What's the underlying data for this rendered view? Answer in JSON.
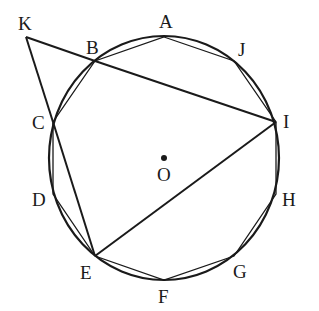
{
  "diagram": {
    "title": "",
    "type": "geometry",
    "colors": {
      "ink": "#1a1a1a",
      "background": "#ffffff"
    },
    "circle": {
      "center": "O",
      "cx": 164,
      "cy": 158,
      "rx": 115,
      "ry": 122
    },
    "points": [
      {
        "name": "A",
        "x": 164,
        "y": 37,
        "label": "A",
        "lx": 159,
        "ly": 28
      },
      {
        "name": "J",
        "x": 234,
        "y": 61,
        "label": "J",
        "lx": 238,
        "ly": 56
      },
      {
        "name": "I",
        "x": 276,
        "y": 122,
        "label": "I",
        "lx": 283,
        "ly": 128
      },
      {
        "name": "H",
        "x": 276,
        "y": 194,
        "label": "H",
        "lx": 282,
        "ly": 206
      },
      {
        "name": "G",
        "x": 234,
        "y": 256,
        "label": "G",
        "lx": 233,
        "ly": 278
      },
      {
        "name": "F",
        "x": 164,
        "y": 280,
        "label": "F",
        "lx": 158,
        "ly": 303
      },
      {
        "name": "E",
        "x": 95,
        "y": 256,
        "label": "E",
        "lx": 80,
        "ly": 279
      },
      {
        "name": "D",
        "x": 53,
        "y": 194,
        "label": "D",
        "lx": 32,
        "ly": 206
      },
      {
        "name": "C",
        "x": 53,
        "y": 122,
        "label": "C",
        "lx": 32,
        "ly": 129
      },
      {
        "name": "B",
        "x": 95,
        "y": 61,
        "label": "B",
        "lx": 86,
        "ly": 54
      },
      {
        "name": "K",
        "x": 26,
        "y": 37,
        "label": "K",
        "lx": 18,
        "ly": 30
      }
    ],
    "center_point": {
      "name": "O",
      "x": 164,
      "y": 158,
      "label": "O",
      "lx": 157,
      "ly": 181
    },
    "polygon": [
      "A",
      "J",
      "I",
      "H",
      "G",
      "F",
      "E",
      "D",
      "C",
      "B"
    ],
    "segments": [
      [
        "K",
        "B"
      ],
      [
        "B",
        "I"
      ],
      [
        "K",
        "C"
      ],
      [
        "C",
        "E"
      ],
      [
        "E",
        "I"
      ]
    ]
  }
}
